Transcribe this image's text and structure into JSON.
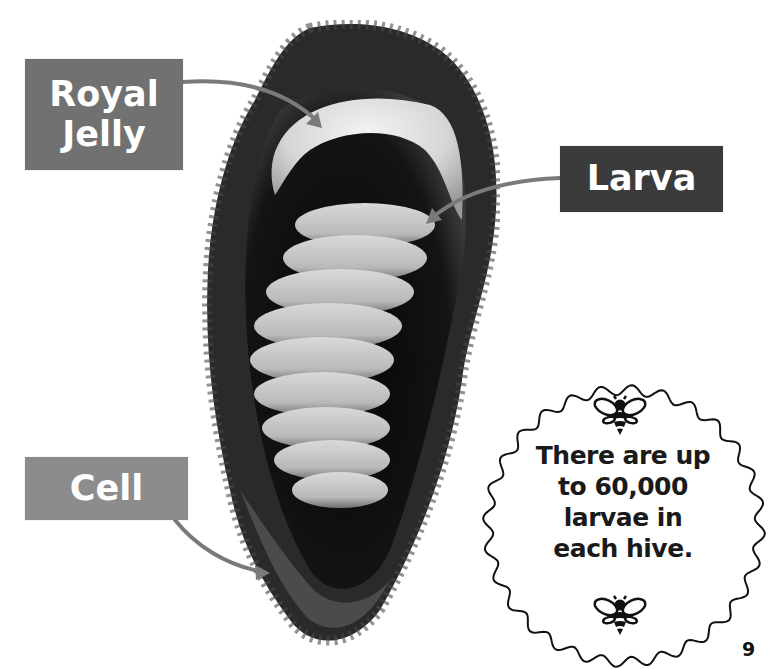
{
  "labels": {
    "royal_jelly": "Royal Jelly",
    "larva": "Larva",
    "cell": "Cell"
  },
  "fact_bubble": {
    "lines": [
      "There are up",
      "to 60,000",
      "larvae in",
      "each hive."
    ],
    "icons": [
      "bee-icon",
      "bee-icon"
    ]
  },
  "page_number": "9",
  "colors": {
    "royal_jelly_box": "#717171",
    "larva_box": "#3b3b3b",
    "cell_box": "#8c8c8c",
    "arrow": "#7a7a7a",
    "text_dark": "#1a1a1a"
  },
  "photo": {
    "subject": "honeybee larva inside wax cell with royal jelly"
  }
}
